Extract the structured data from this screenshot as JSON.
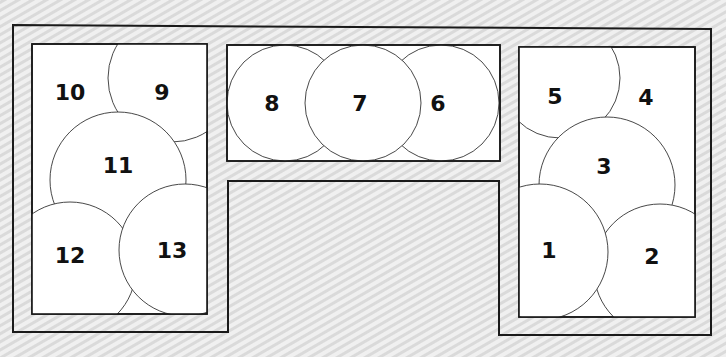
{
  "diagram": {
    "title": "",
    "beds": [
      {
        "id": "left-bed",
        "plants": [
          {
            "label": "10",
            "cx": 70,
            "cy": 92
          },
          {
            "label": "9",
            "cx": 162,
            "cy": 92
          },
          {
            "label": "11",
            "cx": 118,
            "cy": 165
          },
          {
            "label": "12",
            "cx": 70,
            "cy": 255
          },
          {
            "label": "13",
            "cx": 172,
            "cy": 250
          }
        ]
      },
      {
        "id": "middle-bed",
        "plants": [
          {
            "label": "8",
            "cx": 272,
            "cy": 103
          },
          {
            "label": "7",
            "cx": 360,
            "cy": 103
          },
          {
            "label": "6",
            "cx": 438,
            "cy": 103
          }
        ]
      },
      {
        "id": "right-bed",
        "plants": [
          {
            "label": "5",
            "cx": 555,
            "cy": 96
          },
          {
            "label": "4",
            "cx": 646,
            "cy": 97
          },
          {
            "label": "3",
            "cx": 604,
            "cy": 166
          },
          {
            "label": "1",
            "cx": 549,
            "cy": 250
          },
          {
            "label": "2",
            "cx": 652,
            "cy": 256
          }
        ]
      }
    ],
    "colors": {
      "stroke": "#1a1a1a",
      "fill": "#ffffff",
      "text": "#111111"
    }
  }
}
